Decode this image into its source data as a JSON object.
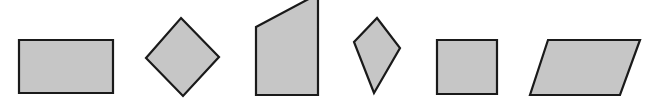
{
  "figure": {
    "name": "quadrilaterals-figure",
    "width": 652,
    "height": 108,
    "background_color": "#ffffff",
    "fill_color": "#c6c6c6",
    "stroke_color": "#1a1a1a",
    "stroke_width": 2.2,
    "shape_count": 6,
    "shapes": [
      {
        "name": "rectangle",
        "label": "Rectangle",
        "points": "19,40 113,40 113,93 19,93",
        "fill": "#c6c6c6",
        "stroke": "#1a1a1a"
      },
      {
        "name": "diamond",
        "label": "Diamond (rhombus)",
        "points": "181,18 219,57 183,96 146,58",
        "fill": "#c6c6c6",
        "stroke": "#1a1a1a"
      },
      {
        "name": "right-trapezoid",
        "label": "Right trapezoid",
        "points": "256,27 318,-6 318,95 256,95",
        "fill": "#c6c6c6",
        "stroke": "#1a1a1a"
      },
      {
        "name": "kite",
        "label": "Kite",
        "points": "377,18 400,48 374,93 354,42",
        "fill": "#c6c6c6",
        "stroke": "#1a1a1a"
      },
      {
        "name": "square",
        "label": "Square",
        "points": "437,40 497,40 497,94 437,94",
        "fill": "#c6c6c6",
        "stroke": "#1a1a1a"
      },
      {
        "name": "parallelogram",
        "label": "Parallelogram",
        "points": "548,40 640,40 620,95 530,95",
        "fill": "#c6c6c6",
        "stroke": "#1a1a1a"
      }
    ]
  }
}
